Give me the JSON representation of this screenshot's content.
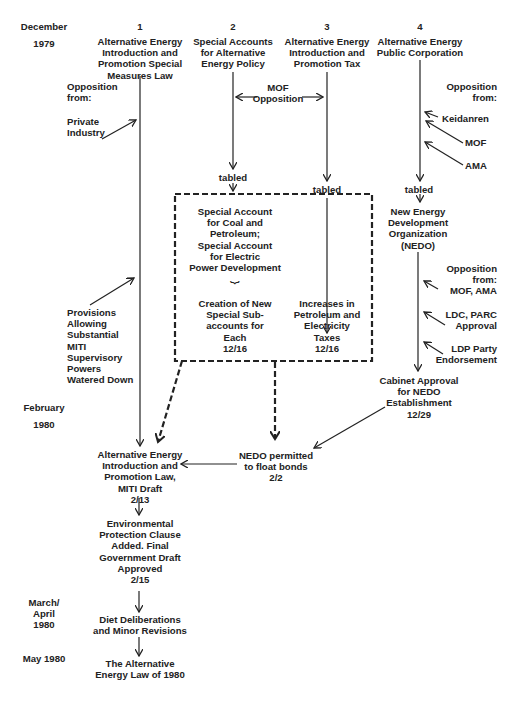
{
  "timeline": {
    "dec_month": "December",
    "dec_year": "1979",
    "feb_month": "February",
    "feb_year": "1980",
    "mar_apr": "March/\nApril\n1980",
    "may": "May 1980"
  },
  "columns": [
    {
      "number": "1",
      "title": "Alternative Energy\nIntroduction and\nPromotion Special\nMeasures Law"
    },
    {
      "number": "2",
      "title": "Special Accounts\nfor Alternative\nEnergy Policy"
    },
    {
      "number": "3",
      "title": "Alternative Energy\nIntroduction and\nPromotion Tax"
    },
    {
      "number": "4",
      "title": "Alternative Energy\nPublic Corporation"
    }
  ],
  "col1": {
    "opposition_label": "Opposition\nfrom:",
    "private_industry": "Private\nIndustry",
    "provisions": "Provisions\nAllowing\nSubstantial\nMITI\nSupervisory\nPowers\nWatered Down"
  },
  "col2_3": {
    "mof_opposition": "MOF\nOpposition",
    "tabled_2": "tabled",
    "tabled_3": "tabled"
  },
  "dashed_box": {
    "special_accounts": "Special Account\nfor Coal and\nPetroleum;\nSpecial Account\nfor Electric\nPower Development",
    "brace": "⏟",
    "sub_accounts": "Creation of New\nSpecial Sub-\naccounts for\nEach\n12/16",
    "tax_increase": "Increases in\nPetroleum and\nElectricity\nTaxes\n12/16"
  },
  "col4": {
    "opposition_label": "Opposition\nfrom:",
    "keidanren": "Keidanren",
    "mof": "MOF",
    "ama": "AMA",
    "tabled": "tabled",
    "nedo": "New Energy\nDevelopment\nOrganization\n(NEDO)",
    "opposition2": "Opposition\nfrom:\nMOF, AMA",
    "ldc_parc": "LDC, PARC\nApproval",
    "ldp": "LDP Party\nEndorsement",
    "cabinet": "Cabinet Approval\nfor NEDO\nEstablishment\n12/29"
  },
  "bottom": {
    "nedo_bonds": "NEDO permitted\nto float bonds\n2/2",
    "miti_draft": "Alternative Energy\nIntroduction and\nPromotion Law,\nMITI Draft\n2/13",
    "env_clause": "Environmental\nProtection Clause\nAdded. Final\nGovernment Draft\nApproved\n2/15",
    "diet": "Diet Deliberations\nand Minor Revisions",
    "final_law": "The Alternative\nEnergy Law of 1980"
  }
}
